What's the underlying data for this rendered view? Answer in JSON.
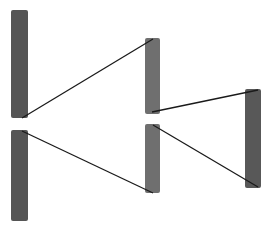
{
  "diagram": {
    "type": "flow-node-link",
    "canvas": {
      "width": 272,
      "height": 229,
      "background": "#ffffff"
    },
    "nodes": [
      {
        "id": "L1",
        "column": 0,
        "x": 11,
        "y": 10,
        "w": 17,
        "h": 108,
        "color": "#555555"
      },
      {
        "id": "L2",
        "column": 0,
        "x": 11,
        "y": 130,
        "w": 17,
        "h": 91,
        "color": "#555555"
      },
      {
        "id": "M1",
        "column": 1,
        "x": 145,
        "y": 38,
        "w": 15,
        "h": 76,
        "color": "#6f6f6f"
      },
      {
        "id": "M2",
        "column": 1,
        "x": 145,
        "y": 124,
        "w": 15,
        "h": 69,
        "color": "#6f6f6f"
      },
      {
        "id": "R1",
        "column": 2,
        "x": 245,
        "y": 89,
        "w": 16,
        "h": 99,
        "color": "#585858"
      }
    ],
    "links": [
      {
        "from": "L1",
        "to": "M1",
        "x1": 22,
        "y1": 118,
        "x2": 153,
        "y2": 39
      },
      {
        "from": "M1",
        "to": "R1",
        "x1": 152,
        "y1": 112,
        "x2": 258,
        "y2": 90
      },
      {
        "from": "L2",
        "to": "M2",
        "x1": 22,
        "y1": 131,
        "x2": 153,
        "y2": 193
      },
      {
        "from": "M2",
        "to": "R1",
        "x1": 153,
        "y1": 125,
        "x2": 258,
        "y2": 187
      }
    ],
    "link_color": "#1a1a1a",
    "link_width": 1.3
  }
}
